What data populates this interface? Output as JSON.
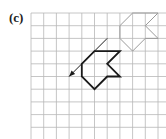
{
  "figure": {
    "label": "(c)",
    "grid": {
      "origin_x": 31,
      "origin_y": 13,
      "cell": 12.7,
      "cols": 11,
      "rows": 10,
      "line_color": "#b8b8b8"
    },
    "original_shape": {
      "description": "faint object shape (top-right)",
      "color": "#9a9a9a",
      "vertices_grid": [
        [
          8,
          0
        ],
        [
          10,
          0
        ],
        [
          9,
          1
        ],
        [
          10,
          2
        ],
        [
          9,
          2
        ],
        [
          8,
          3
        ],
        [
          7,
          2
        ],
        [
          7,
          1
        ]
      ]
    },
    "image_shape": {
      "description": "bold translated shape",
      "color": "#1a1a1a",
      "vertices_grid": [
        [
          5,
          3
        ],
        [
          7,
          3
        ],
        [
          6,
          4
        ],
        [
          7,
          5
        ],
        [
          6,
          5
        ],
        [
          5,
          6
        ],
        [
          4,
          5
        ],
        [
          4,
          4
        ]
      ]
    },
    "translation_arrow": {
      "from_grid": [
        6,
        2
      ],
      "to_grid": [
        3,
        5
      ],
      "color": "#1a1a1a"
    }
  }
}
